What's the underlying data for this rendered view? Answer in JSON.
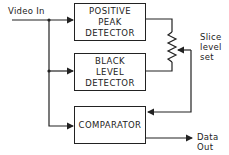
{
  "diagram": {
    "input_label": "Video In",
    "blocks": [
      {
        "id": "positive-peak-detector",
        "lines": [
          "POSITIVE",
          "PEAK",
          "DETECTOR"
        ]
      },
      {
        "id": "black-level-detector",
        "lines": [
          "BLACK",
          "LEVEL",
          "DETECTOR"
        ]
      },
      {
        "id": "comparator",
        "lines": [
          "COMPARATOR"
        ]
      }
    ],
    "pot_label": [
      "Slice",
      "level",
      "set"
    ],
    "output_label": [
      "Data",
      "Out"
    ],
    "line_color": "#222222"
  }
}
